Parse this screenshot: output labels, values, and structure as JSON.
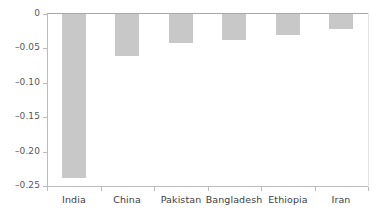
{
  "chart_data": {
    "type": "bar",
    "title": "",
    "subtitle": "",
    "xlabel": "",
    "ylabel": "",
    "orientation": "vertical",
    "grid": false,
    "legend": null,
    "bar_color": "#c8c8c8",
    "axis_color": "#bcbcbc",
    "text_color": "#3d3d3f",
    "categories": [
      "India",
      "China",
      "Pakistan",
      "Bangladesh",
      "Ethiopia",
      "Iran"
    ],
    "values": [
      -0.238,
      -0.061,
      -0.042,
      -0.038,
      -0.031,
      -0.022
    ],
    "ylim": [
      -0.25,
      0
    ],
    "yticks": [
      0,
      -0.05,
      -0.1,
      -0.15,
      -0.2,
      -0.25
    ],
    "ytick_labels": [
      "0",
      "–0.05",
      "–0.10",
      "–0.15",
      "–0.20",
      "–0.25"
    ],
    "annotations": []
  }
}
